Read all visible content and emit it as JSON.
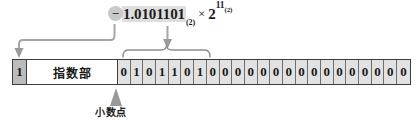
{
  "figure": {
    "formula": {
      "sign_symbol": "−",
      "mantissa": "1.0101101",
      "mantissa_base": "(2)",
      "operator": "×",
      "exponent_base_value": "2",
      "exponent": "11",
      "exponent_subscript": "(2)"
    },
    "bitbar": {
      "sign_bit_label": "1",
      "exponent_field_label": "指数部",
      "mantissa_bits": [
        "0",
        "1",
        "0",
        "1",
        "1",
        "0",
        "1",
        "0",
        "0",
        "0",
        "0",
        "0",
        "0",
        "0",
        "0",
        "0",
        "0",
        "0",
        "0",
        "0",
        "0",
        "0",
        "0"
      ]
    },
    "annotations": {
      "decimal_point_label": "小数点"
    },
    "colors": {
      "sign_cell_fill": "#bcbcbc",
      "bit_cell_fill": "#e2e2e2",
      "highlight_fill": "#dedede",
      "pill_fill": "#c9c9c9",
      "connector_stroke": "#a6a6a6",
      "arrow_fill": "#9a9a9a",
      "border": "#3d3d3d",
      "text": "#1a1a1a"
    }
  }
}
